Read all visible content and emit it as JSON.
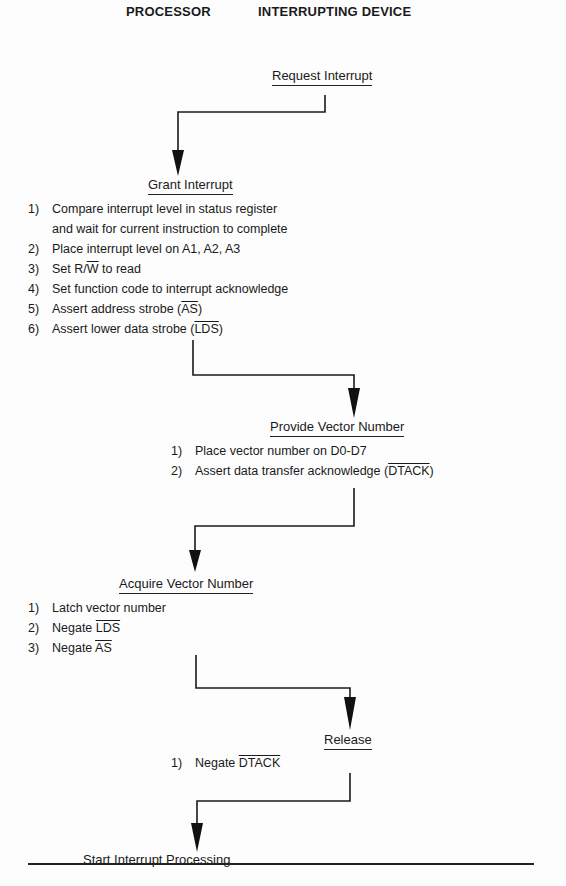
{
  "header": {
    "left": "PROCESSOR",
    "right": "INTERRUPTING DEVICE"
  },
  "steps": {
    "request": {
      "title": "Request Interrupt"
    },
    "grant": {
      "title": "Grant Interrupt",
      "items": [
        {
          "n": "1)",
          "text": "Compare interrupt level in status register"
        },
        {
          "n": "",
          "text": "and wait for current instruction to complete"
        },
        {
          "n": "2)",
          "text": "Place interrupt level on A1, A2, A3"
        },
        {
          "n": "3)",
          "pre": "Set R/",
          "ov": "W",
          "post": " to read"
        },
        {
          "n": "4)",
          "text": "Set function code to interrupt acknowledge"
        },
        {
          "n": "5)",
          "pre": "Assert address strobe (",
          "ov": "AS",
          "post": ")"
        },
        {
          "n": "6)",
          "pre": "Assert lower data strobe (",
          "ov": "LDS",
          "post": ")"
        }
      ]
    },
    "provide": {
      "title": "Provide Vector Number",
      "items": [
        {
          "n": "1)",
          "text": "Place vector number on D0-D7"
        },
        {
          "n": "2)",
          "pre": "Assert data transfer acknowledge (",
          "ov": "DTACK",
          "post": ")"
        }
      ]
    },
    "acquire": {
      "title": "Acquire Vector Number",
      "items": [
        {
          "n": "1)",
          "text": "Latch vector number"
        },
        {
          "n": "2)",
          "pre": "Negate ",
          "ov": "LDS",
          "post": ""
        },
        {
          "n": "3)",
          "pre": "Negate ",
          "ov": "AS",
          "post": ""
        }
      ]
    },
    "release": {
      "title": "Release",
      "items": [
        {
          "n": "1)",
          "pre": "Negate ",
          "ov": "DTACK",
          "post": ""
        }
      ]
    },
    "start": {
      "title": "Start Interrupt Processing"
    }
  }
}
